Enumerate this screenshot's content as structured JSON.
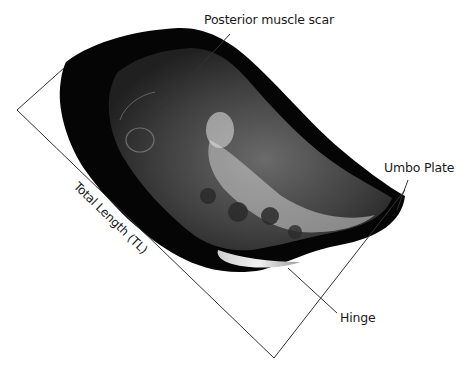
{
  "diagram": {
    "labels": {
      "posterior_muscle_scar": "Posterior muscle scar",
      "umbo_plate": "Umbo Plate",
      "hinge": "Hinge",
      "total_length": "Total Length (TL)"
    },
    "colors": {
      "background": "#ffffff",
      "shell_outer": "#050505",
      "shell_inner": "#3a3a3a",
      "highlight": "#d8d8d8",
      "line": "#333333",
      "text": "#1a1a1a"
    }
  }
}
